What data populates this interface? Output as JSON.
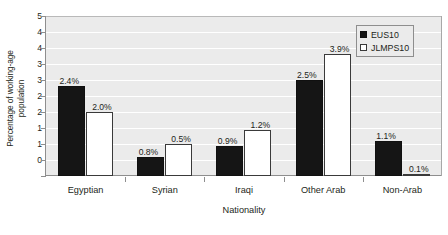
{
  "chart_data": {
    "type": "bar",
    "title": "",
    "xlabel": "Nationality",
    "ylabel_line1": "Percentage of working-age",
    "ylabel_line2": "population",
    "categories": [
      "Egyptian",
      "Syrian",
      "Iraqi",
      "Other Arab",
      "Non-Arab"
    ],
    "series": [
      {
        "name": "EUS10",
        "color": "#151515",
        "values": [
          2.8,
          0.6,
          0.95,
          3.0,
          1.1
        ],
        "labels": [
          "2.4%",
          "0.8%",
          "0.9%",
          "2.5%",
          "1.1%"
        ]
      },
      {
        "name": "JLMPS10",
        "color": "#ffffff",
        "values": [
          2.0,
          1.0,
          1.45,
          3.8,
          0.05
        ],
        "labels": [
          "2.0%",
          "0.5%",
          "1.2%",
          "3.9%",
          "0.1%"
        ]
      }
    ],
    "ylim": [
      0,
      5
    ],
    "ytick_values": [
      5,
      4.5,
      4,
      3.5,
      3,
      2.5,
      2,
      1.5,
      1,
      0.5,
      0
    ],
    "ytick_labels": [
      "5",
      "4",
      "4",
      "3",
      "3",
      "2",
      "2",
      "1",
      "1",
      "0",
      ""
    ],
    "grid": true,
    "legend_position": "top-right",
    "plot_background": "#ebebeb",
    "gridline_color": "#ffffff",
    "axis_color": "#8e8e8e"
  }
}
